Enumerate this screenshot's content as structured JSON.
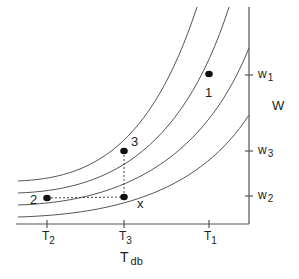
{
  "diagram": {
    "x_axis": {
      "label_main": "T",
      "label_sub": "db",
      "ticks": [
        {
          "main": "T",
          "sub": "2",
          "x": 47
        },
        {
          "main": "T",
          "sub": "3",
          "x": 124
        },
        {
          "main": "T",
          "sub": "1",
          "x": 209
        }
      ]
    },
    "y_axis": {
      "label": "W",
      "ticks": [
        {
          "main": "w",
          "sub": "1",
          "y": 75
        },
        {
          "main": "w",
          "sub": "3",
          "y": 151
        },
        {
          "main": "w",
          "sub": "2",
          "y": 196
        }
      ]
    },
    "points": [
      {
        "label": "1",
        "x": 209,
        "y": 74
      },
      {
        "label": "3",
        "x": 124,
        "y": 151
      },
      {
        "label": "2",
        "x": 47,
        "y": 198
      },
      {
        "label": "x",
        "x": 124,
        "y": 197
      }
    ],
    "curve_count": 4,
    "line_color": "#555555",
    "point_color": "#111111"
  }
}
